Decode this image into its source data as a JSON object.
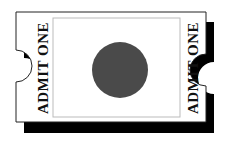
{
  "ticket": {
    "left_label": "ADMIT ONE",
    "right_label": "ADMIT ONE",
    "colors": {
      "paper": "#ffffff",
      "outline": "#222222",
      "shadow": "#000000",
      "inner_border": "#bbbbbb",
      "circle": "#4a4a4a",
      "text": "#111111"
    }
  }
}
